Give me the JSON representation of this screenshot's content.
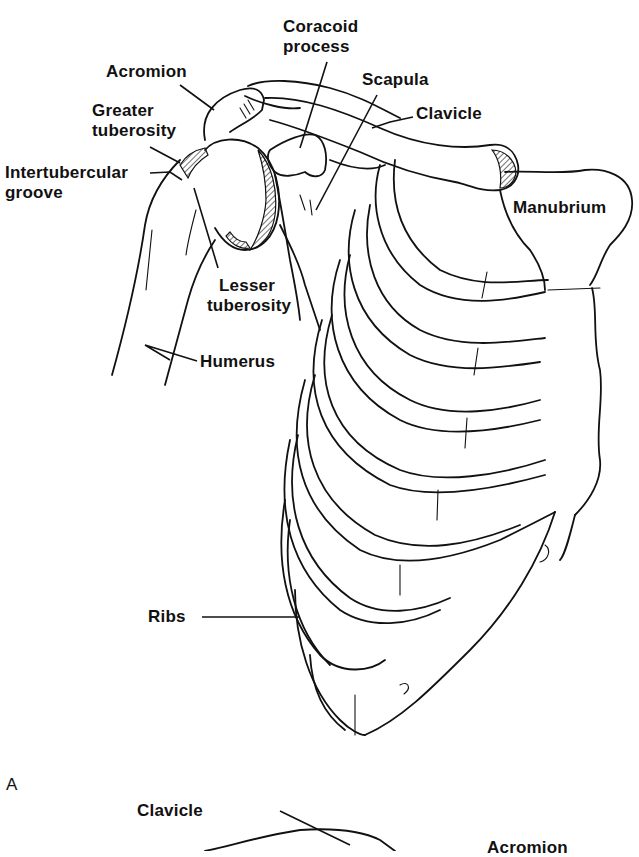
{
  "figure": {
    "panel_a_label": "A",
    "labels": {
      "coracoid_process_line1": "Coracoid",
      "coracoid_process_line2": "process",
      "acromion": "Acromion",
      "scapula": "Scapula",
      "greater_tuberosity_line1": "Greater",
      "greater_tuberosity_line2": "tuberosity",
      "clavicle": "Clavicle",
      "intertubercular_groove_line1": "Intertubercular",
      "intertubercular_groove_line2": "groove",
      "manubrium": "Manubrium",
      "lesser_tuberosity_line1": "Lesser",
      "lesser_tuberosity_line2": "tuberosity",
      "humerus": "Humerus",
      "ribs": "Ribs"
    },
    "panel_b_labels": {
      "clavicle": "Clavicle",
      "acromion": "Acromion"
    },
    "colors": {
      "ink": "#111111",
      "background": "#ffffff"
    }
  }
}
